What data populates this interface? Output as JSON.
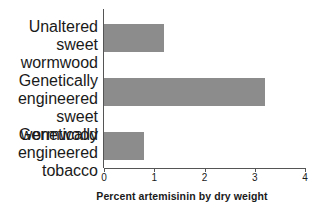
{
  "chart_data": {
    "type": "bar",
    "orientation": "horizontal",
    "title": "",
    "xlabel": "Percent artemisinin by dry weight",
    "ylabel": "",
    "categories": [
      "Unaltered sweet wormwood",
      "Genetically engineered sweet wormwood",
      "Genetically engineered tobacco"
    ],
    "category_lines": [
      [
        "Unaltered",
        "sweet",
        "wormwood"
      ],
      [
        "Genetically",
        "engineered sweet",
        "wormwood"
      ],
      [
        "Genetically",
        "engineered",
        "tobacco"
      ]
    ],
    "values": [
      1.2,
      3.2,
      0.8
    ],
    "xlim": [
      0,
      4
    ],
    "xticks": [
      "0",
      "1",
      "2",
      "3",
      "4"
    ],
    "xtick_values": [
      0,
      1,
      2,
      3,
      4
    ],
    "grid": false,
    "legend": false
  },
  "style": {
    "bar_color": "#8c8c8c",
    "axis_color": "#555555",
    "text_color": "#1a1a1a",
    "background": "#ffffff"
  }
}
